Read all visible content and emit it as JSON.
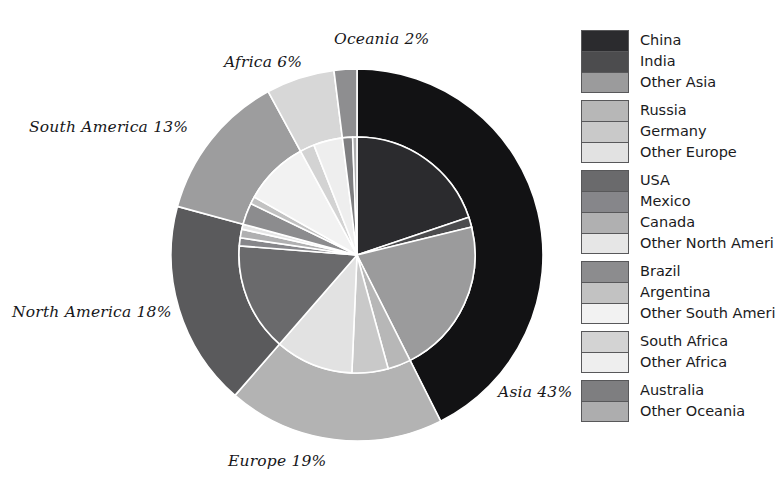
{
  "chart_data": {
    "type": "pie",
    "title": "",
    "subtitle": "",
    "xlabel": "",
    "ylabel": "",
    "variant": "nested-donut",
    "legend_position": "right",
    "grid": false,
    "center": {
      "x": 357,
      "y": 255
    },
    "inner_radius": 118,
    "outer_radius": 186,
    "start_angle_deg": 0,
    "direction": "clockwise",
    "outer_ring": {
      "name": "Continents",
      "categories": [
        "Asia",
        "Europe",
        "North America",
        "South America",
        "Africa",
        "Oceania"
      ],
      "values": [
        43,
        19,
        18,
        13,
        6,
        2
      ],
      "unit": "%",
      "colors": [
        "#121214",
        "#b3b3b3",
        "#5a5a5c",
        "#9d9d9e",
        "#d7d7d7",
        "#8e8e90"
      ],
      "labels": [
        {
          "text": "Asia 43%",
          "x": 498,
          "y": 383
        },
        {
          "text": "Europe 19%",
          "x": 228,
          "y": 452
        },
        {
          "text": "North America 18%",
          "x": 12,
          "y": 303
        },
        {
          "text": "South America 13%",
          "x": 29,
          "y": 118
        },
        {
          "text": "Africa 6%",
          "x": 224,
          "y": 53
        },
        {
          "text": "Oceania 2%",
          "x": 334,
          "y": 30
        }
      ]
    },
    "inner_ring": {
      "name": "Countries",
      "categories": [
        "China",
        "India",
        "Other Asia",
        "Russia",
        "Germany",
        "Other Europe",
        "USA",
        "Mexico",
        "Canada",
        "Other North America",
        "Brazil",
        "Argentina",
        "Other South America",
        "South Africa",
        "Other Africa",
        "Australia",
        "Other Oceania"
      ],
      "values": [
        20.0,
        1.4,
        21.6,
        3.2,
        5.0,
        10.8,
        15.0,
        1.1,
        1.2,
        0.7,
        3.0,
        1.0,
        9.0,
        2.0,
        4.0,
        1.4,
        0.6
      ],
      "unit": "%",
      "colors": [
        "#2b2b2e",
        "#4c4c4e",
        "#9b9b9c",
        "#b7b7b7",
        "#c9c9c9",
        "#e2e2e2",
        "#6a6a6c",
        "#86868a",
        "#b0b0b1",
        "#e6e6e6",
        "#8c8c8e",
        "#c2c2c2",
        "#f2f2f2",
        "#d3d3d3",
        "#eeeeee",
        "#7e7e80",
        "#adadae"
      ]
    }
  },
  "legend": {
    "groups": [
      {
        "group_name": "Asia",
        "items": [
          {
            "label": "China",
            "color": "#2b2b2e"
          },
          {
            "label": "India",
            "color": "#4c4c4e"
          },
          {
            "label": "Other Asia",
            "color": "#9b9b9c"
          }
        ]
      },
      {
        "group_name": "Europe",
        "items": [
          {
            "label": "Russia",
            "color": "#b7b7b7"
          },
          {
            "label": "Germany",
            "color": "#c9c9c9"
          },
          {
            "label": "Other Europe",
            "color": "#e2e2e2"
          }
        ]
      },
      {
        "group_name": "North America",
        "items": [
          {
            "label": "USA",
            "color": "#6a6a6c"
          },
          {
            "label": "Mexico",
            "color": "#86868a"
          },
          {
            "label": "Canada",
            "color": "#b0b0b1"
          },
          {
            "label": "Other North Ameri",
            "color": "#e6e6e6"
          }
        ]
      },
      {
        "group_name": "South America",
        "items": [
          {
            "label": "Brazil",
            "color": "#8c8c8e"
          },
          {
            "label": "Argentina",
            "color": "#c2c2c2"
          },
          {
            "label": "Other South Ameri",
            "color": "#f2f2f2"
          }
        ]
      },
      {
        "group_name": "Africa",
        "items": [
          {
            "label": "South Africa",
            "color": "#d3d3d3"
          },
          {
            "label": "Other Africa",
            "color": "#eeeeee"
          }
        ]
      },
      {
        "group_name": "Oceania",
        "items": [
          {
            "label": "Australia",
            "color": "#7e7e80"
          },
          {
            "label": "Other Oceania",
            "color": "#adadae"
          }
        ]
      }
    ]
  },
  "style": {
    "background": "#ffffff",
    "separator_color": "#ffffff",
    "legend_border": "#58585a",
    "label_color": "#17171a"
  }
}
